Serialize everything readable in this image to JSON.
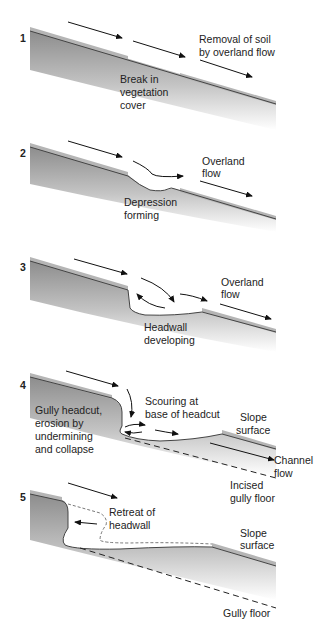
{
  "panels": [
    {
      "number": "1",
      "labels": [
        {
          "lines": [
            "Removal of soil",
            "by overland flow"
          ]
        },
        {
          "lines": [
            "Break in",
            "vegetation",
            "cover"
          ]
        }
      ]
    },
    {
      "number": "2",
      "labels": [
        {
          "lines": [
            "Overland",
            "flow"
          ]
        },
        {
          "lines": [
            "Depression",
            "forming"
          ]
        }
      ]
    },
    {
      "number": "3",
      "labels": [
        {
          "lines": [
            "Overland",
            "flow"
          ]
        },
        {
          "lines": [
            "Headwall",
            "developing"
          ]
        }
      ]
    },
    {
      "number": "4",
      "labels": [
        {
          "lines": [
            "Gully headcut,",
            "erosion by",
            "undermining",
            "and collapse"
          ]
        },
        {
          "lines": [
            "Scouring at",
            "base of headcut"
          ]
        },
        {
          "lines": [
            "Slope",
            "surface"
          ]
        },
        {
          "lines": [
            "Channel",
            "flow"
          ]
        },
        {
          "lines": [
            "Incised",
            "gully floor"
          ]
        }
      ]
    },
    {
      "number": "5",
      "labels": [
        {
          "lines": [
            "Retreat of",
            "headwall"
          ]
        },
        {
          "lines": [
            "Slope",
            "surface"
          ]
        },
        {
          "lines": [
            "Gully floor"
          ]
        }
      ]
    }
  ],
  "colors": {
    "ground_top": "#8a8a8a",
    "ground_fade": "#ffffff",
    "line": "#333333",
    "vegetation": "#bdbdbd"
  }
}
